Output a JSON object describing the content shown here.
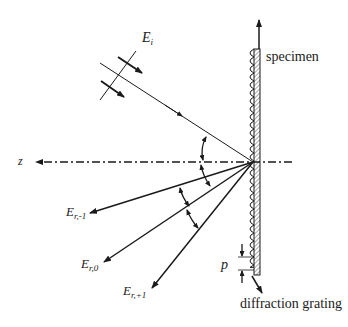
{
  "diagram": {
    "type": "optical-diffraction-schematic",
    "labels": {
      "incident_field": "E",
      "incident_sub": "i",
      "axis_z": "z",
      "specimen": "specimen",
      "grating": "diffraction grating",
      "pitch": "p",
      "reflected": [
        {
          "main": "E",
          "sub": "r,-1"
        },
        {
          "main": "E",
          "sub": "r,0"
        },
        {
          "main": "E",
          "sub": "r,+1"
        }
      ]
    },
    "colors": {
      "line": "#1a1a1a",
      "hatch_fill": "#d9d9d9",
      "background": "#ffffff"
    }
  }
}
